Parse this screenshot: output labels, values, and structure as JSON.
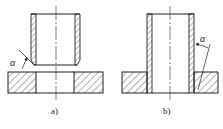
{
  "diagram": {
    "type": "mechanical cross-section drawing",
    "views": [
      {
        "id": "a",
        "label": "a)",
        "description": "Tube with chamfered lower edge positioned above plate hole before press fit",
        "angle_symbol": "α"
      },
      {
        "id": "b",
        "label": "b)",
        "description": "Tube pressed into plate; chamfer angle on plate hole edge",
        "angle_symbol": "α"
      }
    ],
    "colors": {
      "line": "#222222",
      "hatch": "#333333",
      "background": "#ffffff"
    }
  }
}
